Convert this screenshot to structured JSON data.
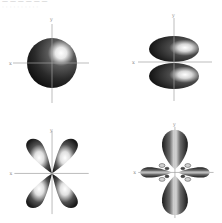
{
  "header_fragment": {
    "line1": "— — — — — —",
    "line2": "· · · · · · · · · ·"
  },
  "axes": {
    "x_label": "x",
    "y_label": "y"
  },
  "colors": {
    "axis": "#9a9a9a",
    "lobe_dark": "#1e1e1e",
    "lobe_mid": "#5a5a5a",
    "highlight": "#ffffff"
  },
  "panels": [
    {
      "position": "top-left",
      "orbital": "s",
      "shape": "sphere",
      "x_label": "x",
      "y_label": "y"
    },
    {
      "position": "top-right",
      "orbital": "p",
      "shape": "two lobes along y-axis",
      "x_label": "x",
      "y_label": "y"
    },
    {
      "position": "bottom-left",
      "orbital": "d",
      "shape": "four-leaf clover between axes",
      "x_label": "x",
      "y_label": "y"
    },
    {
      "position": "bottom-right",
      "orbital": "f",
      "shape": "two large lobes on y, two on x, small lobes in between",
      "x_label": "x",
      "y_label": "y"
    }
  ]
}
